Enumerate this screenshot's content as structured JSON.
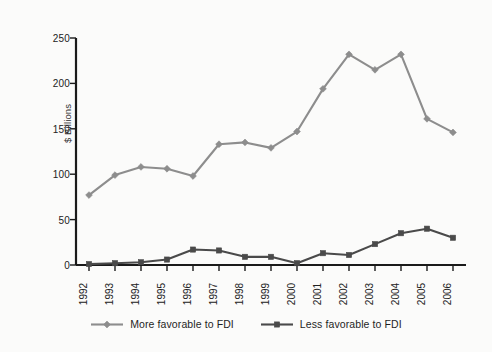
{
  "chart_data": {
    "type": "line",
    "title": "",
    "subtitle": "",
    "xlabel": "",
    "ylabel": "$ Billions",
    "categories": [
      "1992",
      "1993",
      "1994",
      "1995",
      "1996",
      "1997",
      "1998",
      "1999",
      "2000",
      "2001",
      "2002",
      "2003",
      "2004",
      "2005",
      "2006"
    ],
    "ylim": [
      0,
      250
    ],
    "yticks": [
      0,
      50,
      100,
      150,
      200,
      250
    ],
    "grid": false,
    "legend_position": "bottom",
    "series": [
      {
        "name": "More favorable to FDI",
        "color": "#8d8d8d",
        "marker": "diamond",
        "values": [
          77,
          99,
          108,
          106,
          98,
          133,
          135,
          129,
          147,
          194,
          232,
          215,
          232,
          161,
          146
        ]
      },
      {
        "name": "Less favorable to FDI",
        "color": "#4a4a4a",
        "marker": "square",
        "values": [
          1,
          2,
          3,
          6,
          17,
          16,
          9,
          9,
          2,
          13,
          11,
          23,
          35,
          40,
          30
        ]
      }
    ]
  },
  "axis": {
    "y_title": "$ Billions",
    "y_tick_labels": [
      "250",
      "200",
      "150",
      "100",
      "50",
      "0"
    ],
    "x_tick_labels": [
      "1992",
      "1993",
      "1994",
      "1995",
      "1996",
      "1997",
      "1998",
      "1999",
      "2000",
      "2001",
      "2002",
      "2003",
      "2004",
      "2005",
      "2006"
    ]
  },
  "legend": {
    "items": [
      {
        "label": "More favorable to FDI",
        "color": "#8d8d8d",
        "marker": "diamond"
      },
      {
        "label": "Less favorable to FDI",
        "color": "#4a4a4a",
        "marker": "square"
      }
    ]
  },
  "colors": {
    "background": "#fbfbfa",
    "axis": "#1a1a1a",
    "text": "#222222",
    "series_more_favorable": "#8d8d8d",
    "series_less_favorable": "#4a4a4a"
  }
}
